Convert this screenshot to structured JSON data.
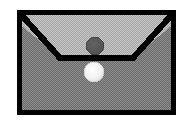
{
  "figure": {
    "title": "Envelope Icon",
    "description": "Grayscale dithered envelope pictogram with closed flap and two circular markers",
    "alt_text": "Envelope with dark circle on flap and white circle on body",
    "background_color": "#ffffff",
    "canvas": {
      "width": 191,
      "height": 127
    }
  },
  "envelope": {
    "name": "envelope",
    "outline_color": "#000000",
    "outline_width": 5,
    "bounds": {
      "x": 17,
      "y": 10,
      "width": 159,
      "height": 105
    },
    "body": {
      "label": "envelope-body",
      "fill_color": "#7a7a7a",
      "pattern": "dither-checker",
      "pattern_light": "#8d8d8d",
      "pattern_dark": "#666666"
    },
    "flap": {
      "label": "envelope-flap",
      "fill_color": "#b3b3b3",
      "pattern": "dither-checker",
      "pattern_light": "#c4c4c4",
      "pattern_dark": "#a1a1a1",
      "shape": "trapezoid-v",
      "fold_line_y": 58,
      "fold_left_x": 60,
      "fold_right_x": 133,
      "fold_color": "#000000",
      "fold_width": 5
    }
  },
  "markers": [
    {
      "label": "dark-seal-marker",
      "shape": "circle",
      "cx": 95,
      "cy": 46,
      "r": 9,
      "fill_color": "#565656",
      "stroke_color": "#3f3f3f",
      "on": "flap"
    },
    {
      "label": "light-seal-marker",
      "shape": "circle",
      "cx": 94,
      "cy": 72,
      "r": 10,
      "fill_color": "#f2f2f2",
      "stroke_color": "#d8d8d8",
      "on": "body"
    }
  ]
}
